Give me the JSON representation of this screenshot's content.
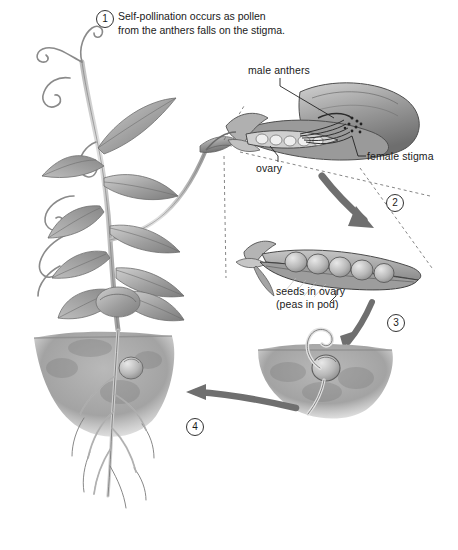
{
  "figure": {
    "kind": "botanical-life-cycle-diagram",
    "style": "grayscale pencil illustration",
    "background_color": "#ffffff",
    "ink_color": "#1a1a1a"
  },
  "caption": {
    "step1_line1": "Self-pollination occurs as pollen",
    "step1_line2": "from the anthers falls on the stigma."
  },
  "step_numbers": {
    "one": "1",
    "two": "2",
    "three": "3",
    "four": "4"
  },
  "labels": {
    "male_anthers": "male anthers",
    "female_stigma": "female stigma",
    "ovary": "ovary",
    "seeds_line1": "seeds in ovary",
    "seeds_line2": "(peas in pod)"
  },
  "scene": {
    "plant": "mature pea vine with leaves, curling tendrils and flower",
    "flower_cutaway": "enlarged longitudinal section of pea flower",
    "pod": "opened pea pod",
    "pod_seed_count": 5,
    "germination": "seed germinating in soil with shoot and root",
    "seedling": "young plant with root system in soil"
  },
  "colors": {
    "soil_dark": "#8e8e8e",
    "soil_mid": "#b4b4b4",
    "soil_light": "#d6d6d6",
    "plant_dark": "#7b7b7b",
    "plant_mid": "#a8a8a8",
    "plant_light": "#cfcfcf",
    "arrow": "#6f6f6f",
    "leader": "#333333"
  }
}
